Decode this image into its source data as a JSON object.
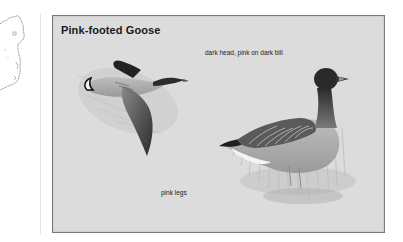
{
  "map": {
    "region": "Ireland (east coast, partial)",
    "icon": "distribution-map"
  },
  "plate": {
    "title": "Pink-footed Goose",
    "annotations": {
      "head": "dark head, pink on dark bill",
      "legs": "pink legs"
    },
    "illustrations": [
      {
        "name": "flying-goose",
        "pose": "in flight"
      },
      {
        "name": "standing-goose",
        "pose": "standing in grass"
      }
    ],
    "colors": {
      "background": "#dcdcdc",
      "border": "#7a7a7a",
      "title": "#1a1a1a",
      "text": "#222222"
    }
  }
}
